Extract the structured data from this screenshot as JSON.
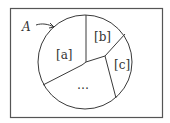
{
  "diagram": {
    "type": "set-partition",
    "outer_label": "A",
    "regions": [
      {
        "id": "a",
        "label": "[a]"
      },
      {
        "id": "b",
        "label": "[b]"
      },
      {
        "id": "c",
        "label": "[c]"
      },
      {
        "id": "rest",
        "label": "…"
      }
    ],
    "colors": {
      "stroke": "#3a3a3a",
      "frame": "#555555",
      "background": "#ffffff"
    }
  }
}
